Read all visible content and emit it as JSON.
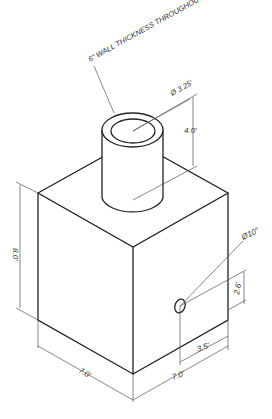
{
  "drawing": {
    "note": "6\" WALL THICKNESS THROUGHOUT",
    "pipe_diameter": "Ø 3.25'",
    "pipe_height": "4.0'",
    "box_height": "8.0'",
    "box_width_left": "7.0'",
    "box_width_right": "7.0'",
    "hole_diameter": "Ø10\"",
    "hole_height": "2.6'",
    "hole_offset": "3.5'"
  },
  "colors": {
    "line": "#222222",
    "dim": "#555555",
    "background": "#ffffff"
  }
}
